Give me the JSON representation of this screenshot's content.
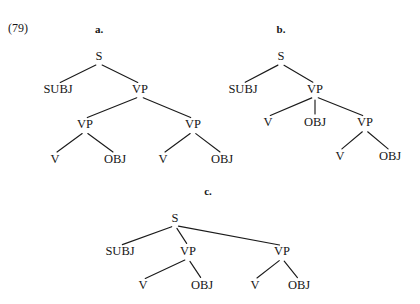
{
  "figure": {
    "example_number": "(79)",
    "example_number_x": 8,
    "example_number_y": 32,
    "background_color": "#ffffff",
    "ink_color": "#161616",
    "line_color": "#1b1b1b"
  },
  "trees": [
    {
      "id": "tree-a",
      "letter": "a.",
      "letter_x": 99,
      "letter_y": 33,
      "nodes": [
        {
          "id": "a-s",
          "label": "S",
          "x": 99,
          "y": 60
        },
        {
          "id": "a-subj",
          "label": "SUBJ",
          "x": 58,
          "y": 93
        },
        {
          "id": "a-vp",
          "label": "VP",
          "x": 140,
          "y": 93
        },
        {
          "id": "a-vp1",
          "label": "VP",
          "x": 85,
          "y": 128
        },
        {
          "id": "a-vp2",
          "label": "VP",
          "x": 193,
          "y": 128
        },
        {
          "id": "a-v1",
          "label": "V",
          "x": 55,
          "y": 163
        },
        {
          "id": "a-obj1",
          "label": "OBJ",
          "x": 115,
          "y": 163
        },
        {
          "id": "a-v2",
          "label": "V",
          "x": 163,
          "y": 163
        },
        {
          "id": "a-obj2",
          "label": "OBJ",
          "x": 222,
          "y": 163
        }
      ],
      "edges": [
        {
          "from": "a-s",
          "to": "a-subj"
        },
        {
          "from": "a-s",
          "to": "a-vp"
        },
        {
          "from": "a-vp",
          "to": "a-vp1"
        },
        {
          "from": "a-vp",
          "to": "a-vp2"
        },
        {
          "from": "a-vp1",
          "to": "a-v1"
        },
        {
          "from": "a-vp1",
          "to": "a-obj1"
        },
        {
          "from": "a-vp2",
          "to": "a-v2"
        },
        {
          "from": "a-vp2",
          "to": "a-obj2"
        }
      ]
    },
    {
      "id": "tree-b",
      "letter": "b.",
      "letter_x": 281,
      "letter_y": 33,
      "nodes": [
        {
          "id": "b-s",
          "label": "S",
          "x": 281,
          "y": 60
        },
        {
          "id": "b-subj",
          "label": "SUBJ",
          "x": 243,
          "y": 93
        },
        {
          "id": "b-vp",
          "label": "VP",
          "x": 315,
          "y": 93
        },
        {
          "id": "b-v1",
          "label": "V",
          "x": 268,
          "y": 126
        },
        {
          "id": "b-obj1",
          "label": "OBJ",
          "x": 315,
          "y": 126
        },
        {
          "id": "b-vp2",
          "label": "VP",
          "x": 365,
          "y": 126
        },
        {
          "id": "b-v2",
          "label": "V",
          "x": 340,
          "y": 160
        },
        {
          "id": "b-obj2",
          "label": "OBJ",
          "x": 390,
          "y": 160
        }
      ],
      "edges": [
        {
          "from": "b-s",
          "to": "b-subj"
        },
        {
          "from": "b-s",
          "to": "b-vp"
        },
        {
          "from": "b-vp",
          "to": "b-v1"
        },
        {
          "from": "b-vp",
          "to": "b-obj1"
        },
        {
          "from": "b-vp",
          "to": "b-vp2"
        },
        {
          "from": "b-vp2",
          "to": "b-v2"
        },
        {
          "from": "b-vp2",
          "to": "b-obj2"
        }
      ]
    },
    {
      "id": "tree-c",
      "letter": "c.",
      "letter_x": 208,
      "letter_y": 195,
      "nodes": [
        {
          "id": "c-s",
          "label": "S",
          "x": 175,
          "y": 222
        },
        {
          "id": "c-subj",
          "label": "SUBJ",
          "x": 120,
          "y": 255
        },
        {
          "id": "c-vp1",
          "label": "VP",
          "x": 188,
          "y": 255
        },
        {
          "id": "c-vp2",
          "label": "VP",
          "x": 282,
          "y": 255
        },
        {
          "id": "c-v1",
          "label": "V",
          "x": 143,
          "y": 289
        },
        {
          "id": "c-obj1",
          "label": "OBJ",
          "x": 202,
          "y": 289
        },
        {
          "id": "c-v2",
          "label": "V",
          "x": 255,
          "y": 289
        },
        {
          "id": "c-obj2",
          "label": "OBJ",
          "x": 299,
          "y": 289
        }
      ],
      "edges": [
        {
          "from": "c-s",
          "to": "c-subj"
        },
        {
          "from": "c-s",
          "to": "c-vp1"
        },
        {
          "from": "c-s",
          "to": "c-vp2"
        },
        {
          "from": "c-vp1",
          "to": "c-v1"
        },
        {
          "from": "c-vp1",
          "to": "c-obj1"
        },
        {
          "from": "c-vp2",
          "to": "c-v2"
        },
        {
          "from": "c-vp2",
          "to": "c-obj2"
        }
      ]
    }
  ]
}
